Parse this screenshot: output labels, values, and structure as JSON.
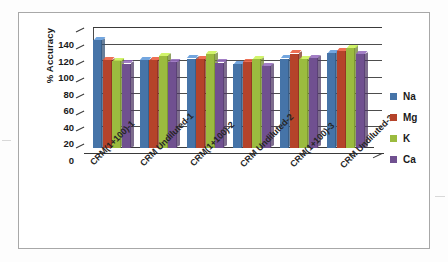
{
  "figure": {
    "kind": "scanned-bar-chart-figure",
    "border_color": "#a8a8a8"
  },
  "chart_data": {
    "type": "bar",
    "title": "",
    "subtitle": "",
    "xlabel": "",
    "ylabel": "% Accuracy",
    "ylim": [
      0,
      140
    ],
    "ytick_step": 20,
    "yticks": [
      140,
      120,
      100,
      80,
      60,
      40,
      20,
      0
    ],
    "ytick_labels": [
      "140",
      "120",
      "100",
      "80",
      "60",
      "40",
      "20",
      "0"
    ],
    "grid": true,
    "grid_axis": "y",
    "legend_position": "right",
    "three_d": true,
    "categories": [
      "CRM(1+100)-1",
      "CRM Undiluted-1",
      "CRM(1+100)-2",
      "CRM Undiluted-2",
      "CRM(1+100)-3",
      "CRM Undiluted-3"
    ],
    "series": [
      {
        "name": "Na",
        "color": "#4674a8",
        "values": [
          130,
          106,
          108,
          101,
          108,
          115
        ]
      },
      {
        "name": "Mg",
        "color": "#b5432a",
        "values": [
          106,
          106,
          107,
          104,
          114,
          117
        ]
      },
      {
        "name": "K",
        "color": "#9bbb3f",
        "values": [
          105,
          111,
          113,
          107,
          107,
          121
        ]
      },
      {
        "name": "Ca",
        "color": "#705090",
        "values": [
          102,
          104,
          103,
          99,
          109,
          113
        ]
      }
    ]
  },
  "legend": {
    "items": [
      {
        "label": "Na",
        "color": "#4674a8"
      },
      {
        "label": "Mg",
        "color": "#b5432a"
      },
      {
        "label": "K",
        "color": "#9bbb3f"
      },
      {
        "label": "Ca",
        "color": "#705090"
      }
    ]
  }
}
